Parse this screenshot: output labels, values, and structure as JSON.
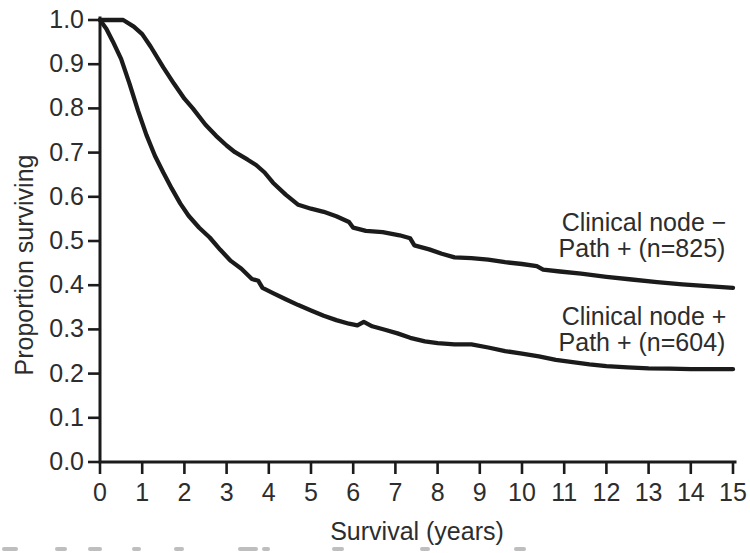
{
  "figure": {
    "background": "#ffffff",
    "line_color": "#1b1b1b",
    "text_color": "#2d2d2d"
  },
  "chart_data": {
    "type": "line",
    "title": "",
    "xlabel": "Survival (years)",
    "ylabel": "Proportion surviving",
    "xlim": [
      0,
      15
    ],
    "ylim": [
      0.0,
      1.0
    ],
    "grid": false,
    "legend_position": "annotations-right-of-curves",
    "x_ticks": [
      0,
      1,
      2,
      3,
      4,
      5,
      6,
      7,
      8,
      9,
      10,
      11,
      12,
      13,
      14,
      15
    ],
    "x_tick_labels": [
      "0",
      "1",
      "2",
      "3",
      "4",
      "5",
      "6",
      "7",
      "8",
      "9",
      "10",
      "11",
      "12",
      "13",
      "14",
      "15"
    ],
    "y_ticks": [
      1.0,
      0.9,
      0.8,
      0.7,
      0.6,
      0.5,
      0.4,
      0.3,
      0.2,
      0.1,
      0.0
    ],
    "y_tick_labels": [
      "1.0",
      "0.9",
      "0.8",
      "0.7",
      "0.6",
      "0.5",
      "0.4",
      "0.3",
      "0.2",
      "0.1",
      "0.0"
    ],
    "series": [
      {
        "name": "Clinical node − Path + (n=825)",
        "label_lines": [
          "Clinical node −",
          "Path + (n=825)"
        ],
        "n": 825,
        "points": [
          [
            0,
            1.0
          ],
          [
            0.55,
            1.0
          ],
          [
            0.8,
            0.985
          ],
          [
            1,
            0.968
          ],
          [
            1.2,
            0.94
          ],
          [
            1.5,
            0.893
          ],
          [
            1.75,
            0.856
          ],
          [
            2,
            0.822
          ],
          [
            2.2,
            0.8
          ],
          [
            2.5,
            0.763
          ],
          [
            2.75,
            0.738
          ],
          [
            3,
            0.716
          ],
          [
            3.2,
            0.701
          ],
          [
            3.5,
            0.684
          ],
          [
            3.7,
            0.672
          ],
          [
            3.9,
            0.655
          ],
          [
            4.1,
            0.632
          ],
          [
            4.4,
            0.605
          ],
          [
            4.7,
            0.582
          ],
          [
            5,
            0.573
          ],
          [
            5.3,
            0.566
          ],
          [
            5.6,
            0.556
          ],
          [
            5.9,
            0.543
          ],
          [
            6.0,
            0.53
          ],
          [
            6.3,
            0.523
          ],
          [
            6.7,
            0.52
          ],
          [
            7.1,
            0.513
          ],
          [
            7.35,
            0.506
          ],
          [
            7.45,
            0.49
          ],
          [
            7.8,
            0.481
          ],
          [
            8.1,
            0.471
          ],
          [
            8.4,
            0.463
          ],
          [
            8.8,
            0.461
          ],
          [
            9.2,
            0.458
          ],
          [
            9.6,
            0.452
          ],
          [
            10,
            0.448
          ],
          [
            10.35,
            0.443
          ],
          [
            10.5,
            0.435
          ],
          [
            10.9,
            0.431
          ],
          [
            11.4,
            0.426
          ],
          [
            12,
            0.419
          ],
          [
            12.6,
            0.413
          ],
          [
            13.2,
            0.407
          ],
          [
            13.8,
            0.402
          ],
          [
            14.4,
            0.398
          ],
          [
            15,
            0.394
          ]
        ]
      },
      {
        "name": "Clinical node + Path + (n=604)",
        "label_lines": [
          "Clinical node +",
          "Path + (n=604)"
        ],
        "n": 604,
        "points": [
          [
            0,
            1.0
          ],
          [
            0.15,
            0.98
          ],
          [
            0.3,
            0.952
          ],
          [
            0.5,
            0.912
          ],
          [
            0.7,
            0.856
          ],
          [
            0.9,
            0.795
          ],
          [
            1.1,
            0.74
          ],
          [
            1.3,
            0.693
          ],
          [
            1.5,
            0.655
          ],
          [
            1.7,
            0.619
          ],
          [
            1.9,
            0.585
          ],
          [
            2.1,
            0.557
          ],
          [
            2.35,
            0.53
          ],
          [
            2.6,
            0.508
          ],
          [
            2.85,
            0.48
          ],
          [
            3.1,
            0.455
          ],
          [
            3.35,
            0.437
          ],
          [
            3.6,
            0.414
          ],
          [
            3.75,
            0.41
          ],
          [
            3.85,
            0.394
          ],
          [
            4.1,
            0.382
          ],
          [
            4.4,
            0.368
          ],
          [
            4.7,
            0.355
          ],
          [
            5,
            0.343
          ],
          [
            5.3,
            0.331
          ],
          [
            5.6,
            0.321
          ],
          [
            5.9,
            0.313
          ],
          [
            6.1,
            0.309
          ],
          [
            6.25,
            0.317
          ],
          [
            6.45,
            0.307
          ],
          [
            6.75,
            0.299
          ],
          [
            7.05,
            0.291
          ],
          [
            7.35,
            0.281
          ],
          [
            7.7,
            0.273
          ],
          [
            8,
            0.269
          ],
          [
            8.4,
            0.266
          ],
          [
            8.8,
            0.266
          ],
          [
            9.2,
            0.259
          ],
          [
            9.6,
            0.251
          ],
          [
            10,
            0.245
          ],
          [
            10.4,
            0.239
          ],
          [
            10.8,
            0.231
          ],
          [
            11.2,
            0.226
          ],
          [
            11.6,
            0.221
          ],
          [
            12,
            0.217
          ],
          [
            12.5,
            0.214
          ],
          [
            13,
            0.212
          ],
          [
            13.5,
            0.211
          ],
          [
            14,
            0.21
          ],
          [
            14.5,
            0.21
          ],
          [
            15,
            0.21
          ]
        ]
      }
    ]
  }
}
